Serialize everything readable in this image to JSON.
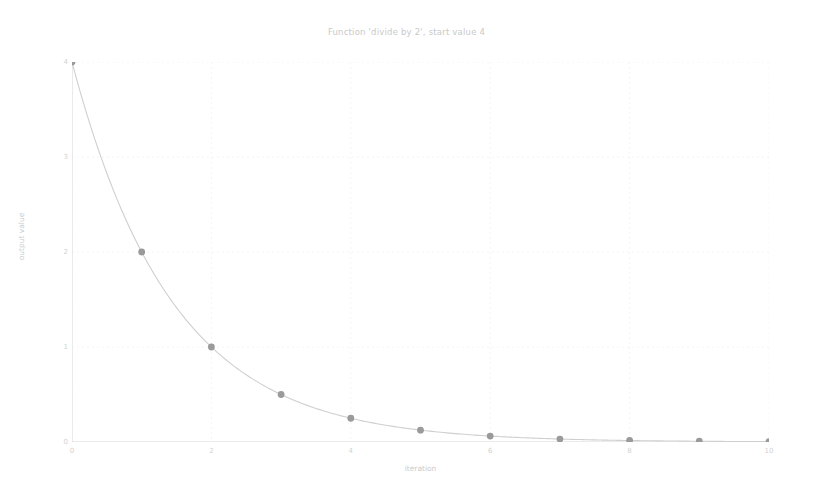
{
  "chart_data": {
    "type": "line",
    "title": "Function 'divide by 2', start value 4",
    "xlabel": "iteration",
    "ylabel": "output value",
    "x": [
      0,
      1,
      2,
      3,
      4,
      5,
      6,
      7,
      8,
      9,
      10
    ],
    "values": [
      4,
      2,
      1,
      0.5,
      0.25,
      0.125,
      0.0625,
      0.03125,
      0.015625,
      0.0078125,
      0.00390625
    ],
    "series": [
      {
        "name": "divide by 2",
        "values": [
          4,
          2,
          1,
          0.5,
          0.25,
          0.125,
          0.0625,
          0.03125,
          0.015625,
          0.0078125,
          0.00390625
        ]
      }
    ],
    "xlim": [
      0,
      10
    ],
    "ylim": [
      0,
      4
    ],
    "xticks": [
      0,
      2,
      4,
      6,
      8,
      10
    ],
    "xtick_labels": [
      "0",
      "2",
      "4",
      "6",
      "8",
      "10"
    ],
    "yticks": [
      0,
      1,
      2,
      3,
      4
    ],
    "ytick_labels": [
      "0",
      "1",
      "2",
      "3",
      "4"
    ],
    "grid": true,
    "legend": false,
    "legend_position": "none",
    "marker": "circle",
    "marker_color": "#9a9a9a",
    "line_color": "#cfcfcf",
    "grid_color": "#f4f4f4",
    "axis_color": "#d8d8d8",
    "background_color": "#ffffff",
    "annotations": []
  }
}
